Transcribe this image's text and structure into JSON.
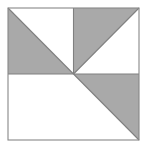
{
  "canvas": {
    "width": 147,
    "height": 152,
    "background_color": "#ffffff"
  },
  "figure": {
    "title": "Square divided into four quadrants with shaded triangles",
    "shape": "square",
    "square_bounds": {
      "x": 8,
      "y": 8,
      "width": 131,
      "height": 132
    },
    "center_point": {
      "x": 73.5,
      "y": 74
    },
    "colors": {
      "shaded_fill": "#a9a9a9",
      "unshaded_fill": "#ffffff",
      "line_stroke": "#808080",
      "border_stroke": "#888888"
    },
    "stroke_width": 1,
    "quadrants": [
      {
        "name": "top-left",
        "bounds": {
          "x": 8,
          "y": 8,
          "width": 65.5,
          "height": 66
        },
        "diagonal": "top-left-to-bottom-right",
        "shaded_half": "lower-left",
        "shaded": true
      },
      {
        "name": "top-right",
        "bounds": {
          "x": 73.5,
          "y": 8,
          "width": 65.5,
          "height": 66
        },
        "diagonal": "bottom-left-to-top-right",
        "shaded_half": "upper-left",
        "shaded": true
      },
      {
        "name": "bottom-left",
        "bounds": {
          "x": 8,
          "y": 74,
          "width": 65.5,
          "height": 66
        },
        "diagonal": "none",
        "shaded_half": "none",
        "shaded": false
      },
      {
        "name": "bottom-right",
        "bounds": {
          "x": 73.5,
          "y": 74,
          "width": 65.5,
          "height": 66
        },
        "diagonal": "top-left-to-bottom-right",
        "shaded_half": "upper-right",
        "shaded": true
      }
    ],
    "divider_lines": [
      {
        "name": "horizontal-midline",
        "x1": 8,
        "y1": 74,
        "x2": 139,
        "y2": 74
      },
      {
        "name": "vertical-upper-midline",
        "x1": 73.5,
        "y1": 8,
        "x2": 73.5,
        "y2": 74
      }
    ],
    "shaded_polygons": [
      {
        "name": "top-left-shaded-triangle",
        "points": "8,8 73.5,74 8,74"
      },
      {
        "name": "top-right-shaded-triangle",
        "points": "73.5,8 139,8 73.5,74"
      },
      {
        "name": "bottom-right-shaded-triangle",
        "points": "73.5,74 139,74 139,140"
      }
    ],
    "diagonal_lines": [
      {
        "name": "top-left-diagonal",
        "x1": 8,
        "y1": 8,
        "x2": 73.5,
        "y2": 74
      },
      {
        "name": "top-right-diagonal",
        "x1": 73.5,
        "y1": 74,
        "x2": 139,
        "y2": 8
      },
      {
        "name": "bottom-right-diagonal",
        "x1": 73.5,
        "y1": 74,
        "x2": 139,
        "y2": 140
      }
    ],
    "shaded_count": 3,
    "total_quadrants": 4
  }
}
